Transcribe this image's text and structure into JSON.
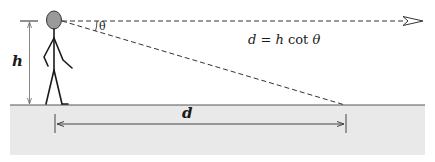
{
  "diagram": {
    "labels": {
      "height": "h",
      "angle": "θ",
      "distance": "d",
      "formula": {
        "lhs": "d",
        "eq": " = ",
        "h": "h",
        "cot": " cot ",
        "theta": "θ"
      }
    },
    "colors": {
      "ground_fill": "#e9e9e9",
      "ground_line": "#555555",
      "head_fill": "#9a9a9a",
      "stroke": "#222222",
      "dim_stroke": "#444444"
    },
    "elements": [
      "person",
      "eye-level line",
      "line of sight",
      "ground",
      "height dimension h",
      "distance dimension d",
      "angle theta"
    ]
  }
}
